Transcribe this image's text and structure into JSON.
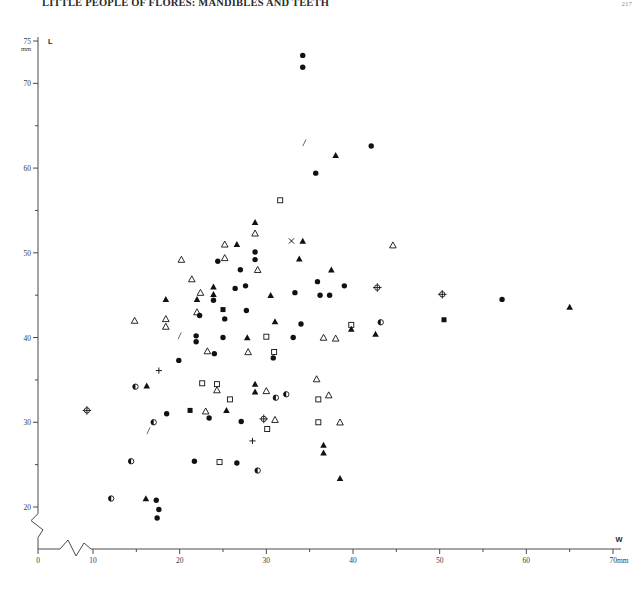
{
  "page": {
    "title": "LITTLE PEOPLE OF FLORES: MANDIBLES AND TEETH",
    "page_number": "217"
  },
  "chart_data": {
    "type": "scatter",
    "title": "",
    "xlabel": "W",
    "ylabel": "L",
    "x_unit": "mm",
    "y_unit": "mm",
    "xlim": [
      0,
      70
    ],
    "ylim": [
      18,
      75
    ],
    "axis_break_x": true,
    "axis_break_y": true,
    "grid": false,
    "legend_position": "none",
    "x_ticks_major": [
      0,
      10,
      20,
      30,
      40,
      50,
      60,
      70
    ],
    "x_ticks_minor": [
      15,
      25,
      35,
      45,
      55,
      65
    ],
    "x_tick_labels": [
      "0",
      "10",
      "20",
      "30",
      "40",
      "50",
      "60",
      "70"
    ],
    "x_axis_end_label": "70mm",
    "y_ticks_major": [
      20,
      30,
      40,
      50,
      60,
      70,
      75
    ],
    "y_ticks_minor": [
      25,
      35,
      45,
      55,
      65
    ],
    "y_tick_labels": [
      "20",
      "30",
      "40",
      "50",
      "60",
      "70",
      "75"
    ],
    "y_axis_top_label": "75",
    "y_axis_top_unit": "mm",
    "marker_types": [
      {
        "key": "filled-circle",
        "name": "filled circle"
      },
      {
        "key": "open-circle",
        "name": "open circle"
      },
      {
        "key": "half-circle",
        "name": "half-filled circle"
      },
      {
        "key": "filled-triangle",
        "name": "filled triangle"
      },
      {
        "key": "open-triangle",
        "name": "open triangle"
      },
      {
        "key": "open-square",
        "name": "open square"
      },
      {
        "key": "filled-square",
        "name": "filled square"
      },
      {
        "key": "cross-circle",
        "name": "crossed circle"
      },
      {
        "key": "plus",
        "name": "plus"
      },
      {
        "key": "ex",
        "name": "x cross"
      },
      {
        "key": "slash",
        "name": "slash tick"
      }
    ],
    "points": [
      {
        "x": 34.2,
        "y": 73.3,
        "m": "filled-circle"
      },
      {
        "x": 34.2,
        "y": 71.9,
        "m": "filled-circle"
      },
      {
        "x": 34.4,
        "y": 63.0,
        "m": "slash"
      },
      {
        "x": 42.1,
        "y": 62.6,
        "m": "filled-circle"
      },
      {
        "x": 38.0,
        "y": 61.5,
        "m": "filled-triangle"
      },
      {
        "x": 35.7,
        "y": 59.4,
        "m": "filled-circle"
      },
      {
        "x": 31.6,
        "y": 56.2,
        "m": "open-square"
      },
      {
        "x": 28.7,
        "y": 53.6,
        "m": "filled-triangle"
      },
      {
        "x": 28.7,
        "y": 52.3,
        "m": "open-triangle"
      },
      {
        "x": 32.9,
        "y": 51.4,
        "m": "ex"
      },
      {
        "x": 34.2,
        "y": 51.4,
        "m": "filled-triangle"
      },
      {
        "x": 25.2,
        "y": 51.0,
        "m": "open-triangle"
      },
      {
        "x": 26.6,
        "y": 51.0,
        "m": "filled-triangle"
      },
      {
        "x": 44.6,
        "y": 50.9,
        "m": "open-triangle"
      },
      {
        "x": 28.7,
        "y": 50.1,
        "m": "filled-circle"
      },
      {
        "x": 28.7,
        "y": 49.2,
        "m": "filled-circle"
      },
      {
        "x": 25.2,
        "y": 49.4,
        "m": "open-triangle"
      },
      {
        "x": 20.2,
        "y": 49.2,
        "m": "open-triangle"
      },
      {
        "x": 24.4,
        "y": 49.0,
        "m": "filled-circle"
      },
      {
        "x": 33.8,
        "y": 49.3,
        "m": "filled-triangle"
      },
      {
        "x": 27.0,
        "y": 48.0,
        "m": "filled-circle"
      },
      {
        "x": 29.0,
        "y": 48.0,
        "m": "open-triangle"
      },
      {
        "x": 37.5,
        "y": 48.0,
        "m": "filled-triangle"
      },
      {
        "x": 21.4,
        "y": 46.9,
        "m": "open-triangle"
      },
      {
        "x": 35.9,
        "y": 46.6,
        "m": "filled-circle"
      },
      {
        "x": 23.9,
        "y": 46.0,
        "m": "filled-triangle"
      },
      {
        "x": 23.9,
        "y": 45.1,
        "m": "filled-triangle"
      },
      {
        "x": 23.9,
        "y": 44.4,
        "m": "filled-circle"
      },
      {
        "x": 22.4,
        "y": 45.3,
        "m": "open-triangle"
      },
      {
        "x": 26.4,
        "y": 45.8,
        "m": "filled-circle"
      },
      {
        "x": 27.6,
        "y": 46.1,
        "m": "filled-circle"
      },
      {
        "x": 42.8,
        "y": 45.9,
        "m": "cross-circle"
      },
      {
        "x": 39.0,
        "y": 46.1,
        "m": "filled-circle"
      },
      {
        "x": 22.0,
        "y": 44.5,
        "m": "filled-triangle"
      },
      {
        "x": 18.4,
        "y": 44.5,
        "m": "filled-triangle"
      },
      {
        "x": 30.5,
        "y": 45.0,
        "m": "filled-triangle"
      },
      {
        "x": 33.3,
        "y": 45.3,
        "m": "filled-circle"
      },
      {
        "x": 36.2,
        "y": 45.0,
        "m": "filled-circle"
      },
      {
        "x": 37.3,
        "y": 45.0,
        "m": "filled-circle"
      },
      {
        "x": 50.3,
        "y": 45.1,
        "m": "cross-circle"
      },
      {
        "x": 57.2,
        "y": 44.5,
        "m": "filled-circle"
      },
      {
        "x": 65.0,
        "y": 43.6,
        "m": "filled-triangle"
      },
      {
        "x": 14.8,
        "y": 42.0,
        "m": "open-triangle"
      },
      {
        "x": 18.4,
        "y": 42.2,
        "m": "open-triangle"
      },
      {
        "x": 18.4,
        "y": 41.3,
        "m": "open-triangle"
      },
      {
        "x": 22.0,
        "y": 43.0,
        "m": "open-triangle"
      },
      {
        "x": 22.3,
        "y": 42.6,
        "m": "filled-circle"
      },
      {
        "x": 25.0,
        "y": 43.3,
        "m": "filled-square"
      },
      {
        "x": 27.7,
        "y": 43.2,
        "m": "filled-circle"
      },
      {
        "x": 25.2,
        "y": 42.2,
        "m": "filled-circle"
      },
      {
        "x": 31.0,
        "y": 41.9,
        "m": "filled-triangle"
      },
      {
        "x": 34.0,
        "y": 41.6,
        "m": "filled-circle"
      },
      {
        "x": 39.8,
        "y": 41.5,
        "m": "open-square"
      },
      {
        "x": 39.8,
        "y": 41.0,
        "m": "filled-triangle"
      },
      {
        "x": 43.2,
        "y": 41.8,
        "m": "half-circle"
      },
      {
        "x": 50.5,
        "y": 42.1,
        "m": "filled-square"
      },
      {
        "x": 20.0,
        "y": 40.2,
        "m": "slash"
      },
      {
        "x": 21.9,
        "y": 40.2,
        "m": "filled-circle"
      },
      {
        "x": 21.9,
        "y": 39.5,
        "m": "filled-circle"
      },
      {
        "x": 25.0,
        "y": 40.0,
        "m": "filled-circle"
      },
      {
        "x": 27.8,
        "y": 40.0,
        "m": "filled-triangle"
      },
      {
        "x": 30.0,
        "y": 40.1,
        "m": "open-square"
      },
      {
        "x": 33.1,
        "y": 40.0,
        "m": "filled-circle"
      },
      {
        "x": 36.6,
        "y": 40.0,
        "m": "open-triangle"
      },
      {
        "x": 38.0,
        "y": 39.9,
        "m": "open-triangle"
      },
      {
        "x": 42.6,
        "y": 40.4,
        "m": "filled-triangle"
      },
      {
        "x": 23.2,
        "y": 38.4,
        "m": "open-triangle"
      },
      {
        "x": 24.0,
        "y": 38.1,
        "m": "filled-circle"
      },
      {
        "x": 27.9,
        "y": 38.3,
        "m": "open-triangle"
      },
      {
        "x": 30.9,
        "y": 38.3,
        "m": "open-square"
      },
      {
        "x": 30.8,
        "y": 37.6,
        "m": "filled-circle"
      },
      {
        "x": 19.9,
        "y": 37.3,
        "m": "filled-circle"
      },
      {
        "x": 35.8,
        "y": 35.1,
        "m": "open-triangle"
      },
      {
        "x": 17.6,
        "y": 36.1,
        "m": "plus"
      },
      {
        "x": 14.9,
        "y": 34.2,
        "m": "half-circle"
      },
      {
        "x": 16.2,
        "y": 34.3,
        "m": "filled-triangle"
      },
      {
        "x": 22.6,
        "y": 34.6,
        "m": "open-square"
      },
      {
        "x": 24.3,
        "y": 34.5,
        "m": "open-square"
      },
      {
        "x": 24.3,
        "y": 33.8,
        "m": "open-triangle"
      },
      {
        "x": 28.7,
        "y": 34.5,
        "m": "filled-triangle"
      },
      {
        "x": 28.7,
        "y": 33.6,
        "m": "filled-triangle"
      },
      {
        "x": 30.0,
        "y": 33.7,
        "m": "open-triangle"
      },
      {
        "x": 32.3,
        "y": 33.3,
        "m": "half-circle"
      },
      {
        "x": 37.2,
        "y": 33.2,
        "m": "open-triangle"
      },
      {
        "x": 31.1,
        "y": 32.9,
        "m": "half-circle"
      },
      {
        "x": 25.8,
        "y": 32.7,
        "m": "open-square"
      },
      {
        "x": 36.0,
        "y": 32.7,
        "m": "open-square"
      },
      {
        "x": 9.3,
        "y": 31.4,
        "m": "cross-circle"
      },
      {
        "x": 21.2,
        "y": 31.4,
        "m": "filled-square"
      },
      {
        "x": 23.0,
        "y": 31.3,
        "m": "open-triangle"
      },
      {
        "x": 25.4,
        "y": 31.4,
        "m": "filled-triangle"
      },
      {
        "x": 18.5,
        "y": 31.0,
        "m": "filled-circle"
      },
      {
        "x": 23.4,
        "y": 30.5,
        "m": "filled-circle"
      },
      {
        "x": 29.7,
        "y": 30.4,
        "m": "cross-circle"
      },
      {
        "x": 31.0,
        "y": 30.3,
        "m": "open-triangle"
      },
      {
        "x": 17.0,
        "y": 30.0,
        "m": "half-circle"
      },
      {
        "x": 16.4,
        "y": 29.0,
        "m": "slash"
      },
      {
        "x": 27.1,
        "y": 30.1,
        "m": "filled-circle"
      },
      {
        "x": 36.0,
        "y": 30.0,
        "m": "open-square"
      },
      {
        "x": 38.5,
        "y": 30.0,
        "m": "open-triangle"
      },
      {
        "x": 30.1,
        "y": 29.2,
        "m": "open-square"
      },
      {
        "x": 28.4,
        "y": 27.8,
        "m": "plus"
      },
      {
        "x": 36.6,
        "y": 27.3,
        "m": "filled-triangle"
      },
      {
        "x": 36.6,
        "y": 26.4,
        "m": "filled-triangle"
      },
      {
        "x": 14.4,
        "y": 25.4,
        "m": "half-circle"
      },
      {
        "x": 21.7,
        "y": 25.4,
        "m": "filled-circle"
      },
      {
        "x": 24.6,
        "y": 25.3,
        "m": "open-square"
      },
      {
        "x": 26.6,
        "y": 25.2,
        "m": "filled-circle"
      },
      {
        "x": 29.0,
        "y": 24.3,
        "m": "half-circle"
      },
      {
        "x": 38.5,
        "y": 23.4,
        "m": "filled-triangle"
      },
      {
        "x": 12.1,
        "y": 21.0,
        "m": "half-circle"
      },
      {
        "x": 16.1,
        "y": 21.0,
        "m": "filled-triangle"
      },
      {
        "x": 17.3,
        "y": 20.8,
        "m": "filled-circle"
      },
      {
        "x": 17.6,
        "y": 19.7,
        "m": "filled-circle"
      },
      {
        "x": 17.4,
        "y": 18.7,
        "m": "filled-circle"
      }
    ]
  }
}
